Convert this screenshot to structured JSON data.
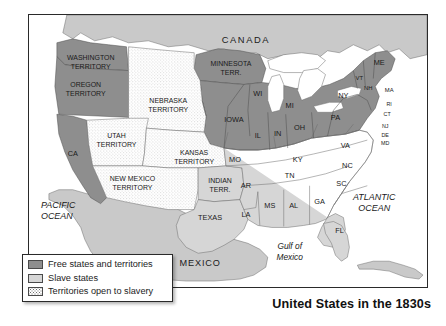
{
  "figure": {
    "caption": "United States in the 1830s"
  },
  "legend": {
    "items": [
      {
        "swatch": "dark-gray-fill",
        "label": "Free states and territories"
      },
      {
        "swatch": "light-gray-fill",
        "label": "Slave states"
      },
      {
        "swatch": "stippled-fill",
        "label": "Territories open to slavery"
      }
    ]
  },
  "colors": {
    "free_states": "#8e8e8e",
    "slave_states": "#d6d6d6",
    "open_territories": "#ffffff",
    "foreign_land": "#c9c9c9",
    "water": "#ffffff",
    "border_line": "#2a2a2a",
    "text": "#1a1a1a"
  },
  "map": {
    "countries": [
      {
        "name": "canada",
        "label": "CANADA",
        "x": 218,
        "y": 26
      },
      {
        "name": "mexico",
        "label": "MEXICO",
        "x": 172,
        "y": 250
      }
    ],
    "waters": [
      {
        "name": "pacific-ocean",
        "label_line1": "PACIFIC",
        "label_line2": "OCEAN",
        "x": 32,
        "y": 196
      },
      {
        "name": "atlantic-ocean",
        "label_line1": "ATLANTIC",
        "label_line2": "OCEAN",
        "x": 345,
        "y": 186
      },
      {
        "name": "gulf-of-mexico",
        "label_line1": "Gulf of",
        "label_line2": "Mexico",
        "x": 262,
        "y": 238
      }
    ],
    "territories": [
      {
        "name": "washington-territory",
        "label_line1": "WASHINGTON",
        "label_line2": "TERRITORY",
        "x": 62,
        "y": 49,
        "category": "free"
      },
      {
        "name": "oregon-territory",
        "label_line1": "OREGON",
        "label_line2": "TERRITORY",
        "x": 57,
        "y": 76,
        "category": "free"
      },
      {
        "name": "minnesota-territory",
        "label_line1": "MINNESOTA",
        "label_line2": "TERR.",
        "x": 205,
        "y": 55,
        "category": "free"
      },
      {
        "name": "nebraska-territory",
        "label_line1": "NEBRASKA",
        "label_line2": "TERRITORY",
        "x": 151,
        "y": 92,
        "category": "open"
      },
      {
        "name": "utah-territory",
        "label_line1": "UTAH",
        "label_line2": "TERRITORY",
        "x": 89,
        "y": 127,
        "category": "open"
      },
      {
        "name": "kansas-territory",
        "label_line1": "KANSAS",
        "label_line2": "TERRITORY",
        "x": 176,
        "y": 144,
        "category": "open"
      },
      {
        "name": "new-mexico-territory",
        "label_line1": "NEW MEXICO",
        "label_line2": "TERRITORY",
        "x": 102,
        "y": 170,
        "category": "open"
      },
      {
        "name": "indian-territory",
        "label_line1": "INDIAN",
        "label_line2": "TERR.",
        "x": 195,
        "y": 177,
        "category": "slave"
      }
    ],
    "states": [
      {
        "name": "california",
        "label": "CA",
        "x": 43,
        "y": 148,
        "category": "free"
      },
      {
        "name": "wisconsin",
        "label": "WI",
        "x": 231,
        "y": 78,
        "category": "free"
      },
      {
        "name": "michigan",
        "label": "MI",
        "x": 262,
        "y": 88,
        "category": "free"
      },
      {
        "name": "iowa",
        "label": "IOWA",
        "x": 212,
        "y": 107,
        "category": "free"
      },
      {
        "name": "illinois",
        "label": "IL",
        "x": 232,
        "y": 123,
        "category": "free"
      },
      {
        "name": "indiana",
        "label": "IN",
        "x": 251,
        "y": 122,
        "category": "free"
      },
      {
        "name": "ohio",
        "label": "OH",
        "x": 272,
        "y": 117,
        "category": "free"
      },
      {
        "name": "pennsylvania",
        "label": "PA",
        "x": 305,
        "y": 104,
        "category": "free"
      },
      {
        "name": "new-york",
        "label": "NY",
        "x": 313,
        "y": 82,
        "category": "free"
      },
      {
        "name": "vermont",
        "label": "VT",
        "x": 330,
        "y": 66,
        "category": "free"
      },
      {
        "name": "new-hampshire",
        "label": "NH",
        "x": 340,
        "y": 75,
        "category": "free"
      },
      {
        "name": "maine",
        "label": "ME",
        "x": 349,
        "y": 51,
        "category": "free"
      },
      {
        "name": "massachusetts",
        "label": "MA",
        "x": 357,
        "y": 76,
        "category": "free"
      },
      {
        "name": "rhode-island",
        "label": "RI",
        "x": 356,
        "y": 89,
        "category": "free"
      },
      {
        "name": "connecticut",
        "label": "CT",
        "x": 353,
        "y": 98,
        "category": "free"
      },
      {
        "name": "new-jersey",
        "label": "NJ",
        "x": 349,
        "y": 110,
        "category": "free"
      },
      {
        "name": "delaware",
        "label": "DE",
        "x": 350,
        "y": 119,
        "category": "slave"
      },
      {
        "name": "maryland",
        "label": "MD",
        "x": 350,
        "y": 127,
        "category": "slave"
      },
      {
        "name": "virginia",
        "label": "VA",
        "x": 313,
        "y": 133,
        "category": "slave"
      },
      {
        "name": "missouri",
        "label": "MO",
        "x": 212,
        "y": 147,
        "category": "slave"
      },
      {
        "name": "kentucky",
        "label": "KY",
        "x": 270,
        "y": 147,
        "category": "slave"
      },
      {
        "name": "tennessee",
        "label": "TN",
        "x": 265,
        "y": 163,
        "category": "slave"
      },
      {
        "name": "north-carolina",
        "label": "NC",
        "x": 317,
        "y": 155,
        "category": "slave"
      },
      {
        "name": "south-carolina",
        "label": "SC",
        "x": 311,
        "y": 172,
        "category": "slave"
      },
      {
        "name": "arkansas",
        "label": "AR",
        "x": 219,
        "y": 173,
        "category": "slave"
      },
      {
        "name": "mississippi",
        "label": "MS",
        "x": 244,
        "y": 192,
        "category": "slave"
      },
      {
        "name": "alabama",
        "label": "AL",
        "x": 268,
        "y": 192,
        "category": "slave"
      },
      {
        "name": "georgia",
        "label": "GA",
        "x": 293,
        "y": 190,
        "category": "slave"
      },
      {
        "name": "louisiana",
        "label": "LA",
        "x": 221,
        "y": 203,
        "category": "slave"
      },
      {
        "name": "florida",
        "label": "FL",
        "x": 313,
        "y": 221,
        "category": "slave"
      },
      {
        "name": "texas",
        "label": "TEXAS",
        "x": 186,
        "y": 206,
        "category": "slave"
      }
    ]
  }
}
